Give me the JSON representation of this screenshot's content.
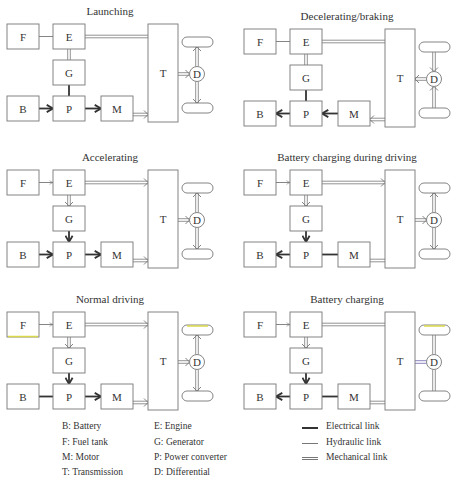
{
  "colors": {
    "stroke": "#777777",
    "electrical": "#333333",
    "text": "#333333",
    "highlight_yellow": "#d9d84a",
    "highlight_blue": "#6a66b0"
  },
  "panels": [
    {
      "id": "launching",
      "title": "Launching",
      "origin": [
        0,
        0
      ],
      "links": {
        "F-E": "hydraulic-plain",
        "E-G": "mechanical-plain",
        "E-T": "mechanical-plain",
        "G-P": "electrical-plain",
        "B-P": "electrical-arrow-right",
        "P-M": "electrical-arrow-right",
        "M-T": "mechanical-arrow-right",
        "T-D": "mechanical-arrow-right",
        "D-wheels": "mechanical-arrow-out"
      }
    },
    {
      "id": "decelerating-braking",
      "title": "Decelerating/braking",
      "origin": [
        237,
        5
      ],
      "links": {
        "F-E": "hydraulic-plain",
        "E-G": "mechanical-plain",
        "E-T": "mechanical-plain",
        "G-P": "electrical-plain",
        "B-P": "electrical-arrow-left",
        "P-M": "electrical-arrow-left",
        "M-T": "mechanical-arrow-left",
        "T-D": "mechanical-arrow-left",
        "D-wheels": "mechanical-arrow-in"
      }
    },
    {
      "id": "accelerating",
      "title": "Accelerating",
      "origin": [
        0,
        146
      ],
      "links": {
        "F-E": "hydraulic-arrow-right",
        "E-G": "mechanical-arrow-down",
        "E-T": "mechanical-arrow-right",
        "G-P": "electrical-arrow-down",
        "B-P": "electrical-arrow-right",
        "P-M": "electrical-arrow-right",
        "M-T": "mechanical-arrow-right",
        "T-D": "mechanical-arrow-right",
        "D-wheels": "mechanical-arrow-out"
      }
    },
    {
      "id": "battery-charging-during-driving",
      "title": "Battery charging during driving",
      "origin": [
        237,
        146
      ],
      "links": {
        "F-E": "hydraulic-arrow-right",
        "E-G": "mechanical-arrow-down",
        "E-T": "mechanical-arrow-right",
        "G-P": "electrical-arrow-down",
        "B-P": "electrical-arrow-left",
        "P-M": "electrical-plain",
        "M-T": "mechanical-plain",
        "T-D": "mechanical-arrow-right",
        "D-wheels": "mechanical-arrow-out"
      }
    },
    {
      "id": "normal-driving",
      "title": "Normal driving",
      "origin": [
        0,
        288
      ],
      "highlight": {
        "F": "yellow",
        "top-wheel": "yellow"
      },
      "links": {
        "F-E": "hydraulic-arrow-right",
        "E-G": "mechanical-arrow-down",
        "E-T": "mechanical-arrow-right",
        "G-P": "electrical-arrow-down",
        "B-P": "electrical-plain",
        "P-M": "electrical-arrow-right",
        "M-T": "mechanical-arrow-right",
        "T-D": "mechanical-arrow-right",
        "D-wheels": "mechanical-arrow-out"
      }
    },
    {
      "id": "battery-charging",
      "title": "Battery charging",
      "origin": [
        237,
        288
      ],
      "highlight": {
        "top-wheel": "yellow",
        "T-D": "blue"
      },
      "links": {
        "F-E": "hydraulic-arrow-right",
        "E-G": "mechanical-arrow-down",
        "E-T": "mechanical-plain",
        "G-P": "electrical-arrow-down",
        "B-P": "electrical-arrow-left",
        "P-M": "electrical-plain",
        "M-T": "mechanical-plain",
        "T-D": "mechanical-plain",
        "D-wheels": "mechanical-plain"
      }
    }
  ],
  "component_labels": {
    "F": "F",
    "E": "E",
    "G": "G",
    "B": "B",
    "P": "P",
    "M": "M",
    "T": "T",
    "D": "D"
  },
  "legend": {
    "components": [
      {
        "key": "B",
        "text": "B: Battery"
      },
      {
        "key": "F",
        "text": "F: Fuel tank"
      },
      {
        "key": "M",
        "text": "M: Motor"
      },
      {
        "key": "T",
        "text": "T: Transmission"
      },
      {
        "key": "E",
        "text": "E: Engine"
      },
      {
        "key": "G",
        "text": "G: Generator"
      },
      {
        "key": "P",
        "text": "P: Power converter"
      },
      {
        "key": "D",
        "text": "D: Differential"
      }
    ],
    "links": [
      {
        "type": "electrical",
        "text": "Electrical link"
      },
      {
        "type": "hydraulic",
        "text": "Hydraulic link"
      },
      {
        "type": "mechanical",
        "text": "Mechanical link"
      }
    ]
  }
}
